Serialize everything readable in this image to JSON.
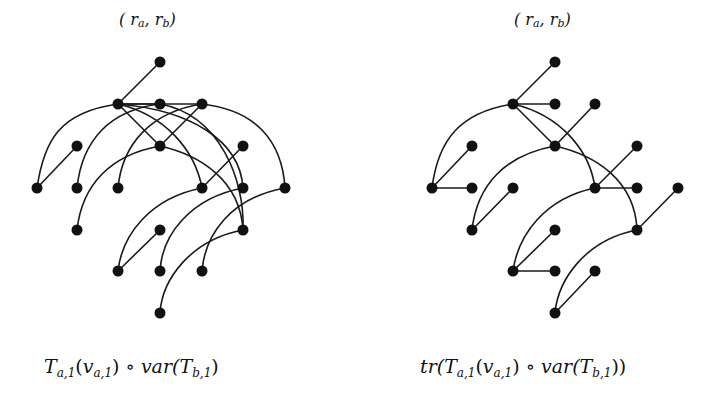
{
  "figure": {
    "left": {
      "title": "(ra, rb)",
      "title_parts": {
        "open": "( r",
        "sub_a": "a",
        "comma": ", r",
        "sub_b": "b",
        "close": ")"
      },
      "caption": "Ta,1(va,1) ∘ var(Tb,1)",
      "caption_parts": {
        "t1": "T",
        "t1_sub": "a,1",
        "paren_open": "(",
        "v": "v",
        "v_sub": "a,1",
        "paren_close": ")",
        "circ": " ∘ ",
        "var": "var(",
        "t2": "T",
        "t2_sub": "b,1",
        "end": ")"
      },
      "nodes": [
        [
          160,
          62
        ],
        [
          118,
          104
        ],
        [
          160,
          104
        ],
        [
          202,
          104
        ],
        [
          77,
          146
        ],
        [
          160,
          146
        ],
        [
          243,
          146
        ],
        [
          37,
          188
        ],
        [
          77,
          188
        ],
        [
          118,
          188
        ],
        [
          202,
          188
        ],
        [
          243,
          188
        ],
        [
          285,
          188
        ],
        [
          77,
          230
        ],
        [
          160,
          230
        ],
        [
          243,
          230
        ],
        [
          118,
          271
        ],
        [
          160,
          271
        ],
        [
          202,
          271
        ],
        [
          160,
          313
        ]
      ],
      "edges": [
        {
          "from": [
            118,
            104
          ],
          "to": [
            160,
            62
          ],
          "type": "line"
        },
        {
          "from": [
            118,
            104
          ],
          "to": [
            160,
            104
          ],
          "type": "line"
        },
        {
          "from": [
            118,
            104
          ],
          "to": [
            202,
            104
          ],
          "type": "line"
        },
        {
          "from": [
            118,
            104
          ],
          "to": [
            37,
            188
          ],
          "type": "curve",
          "c1": [
            60,
            112
          ],
          "c2": [
            44,
            140
          ]
        },
        {
          "from": [
            118,
            104
          ],
          "to": [
            160,
            146
          ],
          "type": "line"
        },
        {
          "from": [
            118,
            104
          ],
          "to": [
            202,
            188
          ],
          "type": "curve",
          "c1": [
            165,
            115
          ],
          "c2": [
            195,
            150
          ]
        },
        {
          "from": [
            118,
            104
          ],
          "to": [
            243,
            188
          ],
          "type": "curve",
          "c1": [
            190,
            110
          ],
          "c2": [
            240,
            140
          ]
        },
        {
          "from": [
            160,
            104
          ],
          "to": [
            77,
            188
          ],
          "type": "curve",
          "c1": [
            110,
            110
          ],
          "c2": [
            82,
            140
          ]
        },
        {
          "from": [
            160,
            104
          ],
          "to": [
            243,
            230
          ],
          "type": "curve",
          "c1": [
            220,
            115
          ],
          "c2": [
            245,
            180
          ]
        },
        {
          "from": [
            202,
            104
          ],
          "to": [
            118,
            188
          ],
          "type": "curve",
          "c1": [
            150,
            112
          ],
          "c2": [
            122,
            145
          ]
        },
        {
          "from": [
            202,
            104
          ],
          "to": [
            160,
            146
          ],
          "type": "line"
        },
        {
          "from": [
            202,
            104
          ],
          "to": [
            285,
            188
          ],
          "type": "curve",
          "c1": [
            255,
            110
          ],
          "c2": [
            282,
            140
          ]
        },
        {
          "from": [
            37,
            188
          ],
          "to": [
            77,
            146
          ],
          "type": "line"
        },
        {
          "from": [
            160,
            146
          ],
          "to": [
            77,
            230
          ],
          "type": "curve",
          "c1": [
            110,
            155
          ],
          "c2": [
            82,
            185
          ]
        },
        {
          "from": [
            160,
            146
          ],
          "to": [
            243,
            230
          ],
          "type": "curve",
          "c1": [
            200,
            155
          ],
          "c2": [
            240,
            180
          ]
        },
        {
          "from": [
            202,
            188
          ],
          "to": [
            243,
            146
          ],
          "type": "line"
        },
        {
          "from": [
            202,
            188
          ],
          "to": [
            118,
            271
          ],
          "type": "curve",
          "c1": [
            150,
            198
          ],
          "c2": [
            122,
            235
          ]
        },
        {
          "from": [
            118,
            271
          ],
          "to": [
            160,
            230
          ],
          "type": "line"
        },
        {
          "from": [
            243,
            188
          ],
          "to": [
            160,
            271
          ],
          "type": "curve",
          "c1": [
            190,
            198
          ],
          "c2": [
            162,
            235
          ]
        },
        {
          "from": [
            285,
            188
          ],
          "to": [
            202,
            271
          ],
          "type": "curve",
          "c1": [
            230,
            198
          ],
          "c2": [
            205,
            235
          ]
        },
        {
          "from": [
            243,
            230
          ],
          "to": [
            160,
            313
          ],
          "type": "curve",
          "c1": [
            190,
            240
          ],
          "c2": [
            162,
            280
          ]
        }
      ]
    },
    "right": {
      "title": "(ra, rb)",
      "title_parts": {
        "open": "( r",
        "sub_a": "a",
        "comma": ", r",
        "sub_b": "b",
        "close": ")"
      },
      "caption": "tr(Ta,1(va,1) ∘ var(Tb,1))",
      "caption_parts": {
        "tr": "tr(",
        "t1": "T",
        "t1_sub": "a,1",
        "paren_open": "(",
        "v": "v",
        "v_sub": "a,1",
        "paren_close": ")",
        "circ": " ∘ ",
        "var": "var(",
        "t2": "T",
        "t2_sub": "b,1",
        "end": "))"
      },
      "nodes": [
        [
          555,
          62
        ],
        [
          513,
          104
        ],
        [
          555,
          104
        ],
        [
          595,
          104
        ],
        [
          472,
          146
        ],
        [
          555,
          146
        ],
        [
          637,
          146
        ],
        [
          432,
          188
        ],
        [
          472,
          188
        ],
        [
          513,
          188
        ],
        [
          595,
          188
        ],
        [
          637,
          188
        ],
        [
          678,
          188
        ],
        [
          472,
          230
        ],
        [
          555,
          230
        ],
        [
          637,
          230
        ],
        [
          513,
          271
        ],
        [
          555,
          271
        ],
        [
          595,
          271
        ],
        [
          555,
          313
        ]
      ],
      "edges": [
        {
          "from": [
            513,
            104
          ],
          "to": [
            555,
            62
          ],
          "type": "line"
        },
        {
          "from": [
            513,
            104
          ],
          "to": [
            555,
            104
          ],
          "type": "line"
        },
        {
          "from": [
            513,
            104
          ],
          "to": [
            432,
            188
          ],
          "type": "curve",
          "c1": [
            460,
            112
          ],
          "c2": [
            438,
            140
          ]
        },
        {
          "from": [
            513,
            104
          ],
          "to": [
            555,
            146
          ],
          "type": "line"
        },
        {
          "from": [
            513,
            104
          ],
          "to": [
            595,
            188
          ],
          "type": "curve",
          "c1": [
            560,
            115
          ],
          "c2": [
            590,
            150
          ]
        },
        {
          "from": [
            432,
            188
          ],
          "to": [
            472,
            146
          ],
          "type": "line"
        },
        {
          "from": [
            432,
            188
          ],
          "to": [
            472,
            188
          ],
          "type": "line"
        },
        {
          "from": [
            555,
            146
          ],
          "to": [
            595,
            104
          ],
          "type": "line"
        },
        {
          "from": [
            555,
            146
          ],
          "to": [
            472,
            230
          ],
          "type": "curve",
          "c1": [
            505,
            155
          ],
          "c2": [
            477,
            185
          ]
        },
        {
          "from": [
            555,
            146
          ],
          "to": [
            637,
            230
          ],
          "type": "curve",
          "c1": [
            595,
            155
          ],
          "c2": [
            635,
            180
          ]
        },
        {
          "from": [
            472,
            230
          ],
          "to": [
            513,
            188
          ],
          "type": "line"
        },
        {
          "from": [
            595,
            188
          ],
          "to": [
            637,
            146
          ],
          "type": "line"
        },
        {
          "from": [
            595,
            188
          ],
          "to": [
            637,
            188
          ],
          "type": "line"
        },
        {
          "from": [
            595,
            188
          ],
          "to": [
            513,
            271
          ],
          "type": "curve",
          "c1": [
            545,
            198
          ],
          "c2": [
            518,
            235
          ]
        },
        {
          "from": [
            637,
            230
          ],
          "to": [
            678,
            188
          ],
          "type": "line"
        },
        {
          "from": [
            637,
            230
          ],
          "to": [
            555,
            313
          ],
          "type": "curve",
          "c1": [
            585,
            240
          ],
          "c2": [
            558,
            280
          ]
        },
        {
          "from": [
            513,
            271
          ],
          "to": [
            555,
            230
          ],
          "type": "line"
        },
        {
          "from": [
            513,
            271
          ],
          "to": [
            555,
            271
          ],
          "type": "line"
        },
        {
          "from": [
            555,
            313
          ],
          "to": [
            595,
            271
          ],
          "type": "line"
        }
      ]
    },
    "style": {
      "node_color": "#111111",
      "edge_color": "#1a1a1a",
      "node_radius": 5.5,
      "edge_width": 1.6
    }
  }
}
